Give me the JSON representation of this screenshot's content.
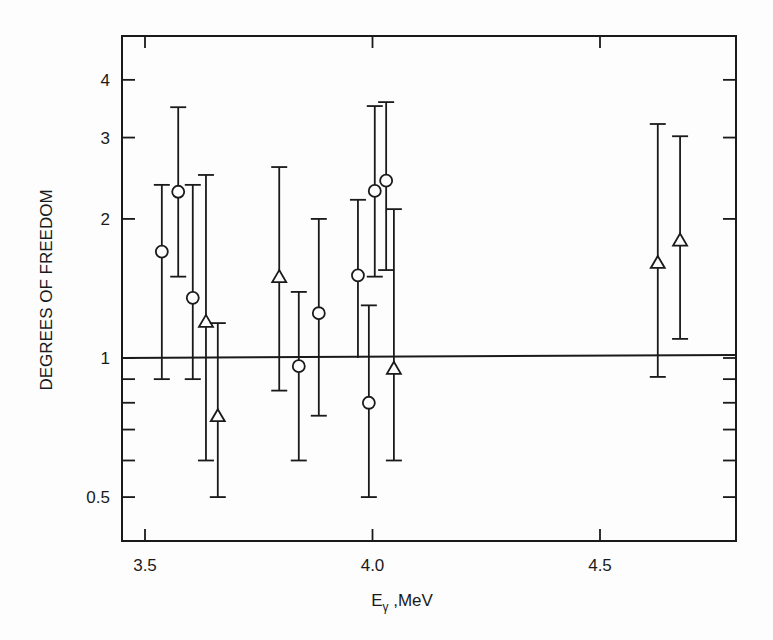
{
  "chart_data": {
    "type": "scatter",
    "title": "",
    "xlabel": "Eγ ,MeV",
    "xlabel_main": "E",
    "xlabel_sub": "γ",
    "xlabel_rest": " ,MeV",
    "ylabel": "DEGREES OF FREEDOM",
    "xlim": [
      3.45,
      4.82
    ],
    "ylim": [
      0.41,
      5.1
    ],
    "yscale": "log",
    "grid": false,
    "legend": null,
    "x_ticks": [
      {
        "value": 3.5,
        "label": "3.5"
      },
      {
        "value": 4.0,
        "label": "4.0"
      },
      {
        "value": 4.5,
        "label": "4.5"
      }
    ],
    "y_ticks": [
      {
        "value": 0.5,
        "label": "0.5"
      },
      {
        "value": 0.6,
        "label": ""
      },
      {
        "value": 0.7,
        "label": ""
      },
      {
        "value": 0.8,
        "label": ""
      },
      {
        "value": 0.9,
        "label": ""
      },
      {
        "value": 1,
        "label": "1"
      },
      {
        "value": 2,
        "label": "2"
      },
      {
        "value": 3,
        "label": "3"
      },
      {
        "value": 4,
        "label": "4"
      }
    ],
    "reference_line": {
      "y": 1,
      "style": "solid"
    },
    "series": [
      {
        "name": "circles",
        "marker": "circle",
        "points": [
          {
            "x": 3.537,
            "y": 1.7,
            "ylow": 0.9,
            "yhigh": 2.37
          },
          {
            "x": 3.573,
            "y": 2.29,
            "ylow": 1.5,
            "yhigh": 3.49
          },
          {
            "x": 3.605,
            "y": 1.35,
            "ylow": 0.9,
            "yhigh": 2.37
          },
          {
            "x": 3.838,
            "y": 0.96,
            "ylow": 0.6,
            "yhigh": 1.39
          },
          {
            "x": 3.882,
            "y": 1.25,
            "ylow": 0.75,
            "yhigh": 2.0
          },
          {
            "x": 3.968,
            "y": 1.51,
            "ylow": 1.0,
            "yhigh": 2.2,
            "no_low_cap": true
          },
          {
            "x": 3.992,
            "y": 0.8,
            "ylow": 0.5,
            "yhigh": 1.3
          },
          {
            "x": 4.005,
            "y": 2.3,
            "ylow": 1.5,
            "yhigh": 3.51
          },
          {
            "x": 4.03,
            "y": 2.42,
            "ylow": 1.55,
            "yhigh": 3.58
          }
        ]
      },
      {
        "name": "triangles",
        "marker": "triangle",
        "points": [
          {
            "x": 3.634,
            "y": 1.2,
            "ylow": 0.6,
            "yhigh": 2.49
          },
          {
            "x": 3.66,
            "y": 0.75,
            "ylow": 0.5,
            "yhigh": 1.19
          },
          {
            "x": 3.795,
            "y": 1.5,
            "ylow": 0.85,
            "yhigh": 2.59
          },
          {
            "x": 4.047,
            "y": 0.95,
            "ylow": 0.6,
            "yhigh": 2.1
          },
          {
            "x": 4.627,
            "y": 1.61,
            "ylow": 0.91,
            "yhigh": 3.21
          },
          {
            "x": 4.676,
            "y": 1.8,
            "ylow": 1.1,
            "yhigh": 3.02
          }
        ]
      }
    ]
  },
  "colors": {
    "ink": "#1a1a1a",
    "paper": "#fdfdfd"
  }
}
